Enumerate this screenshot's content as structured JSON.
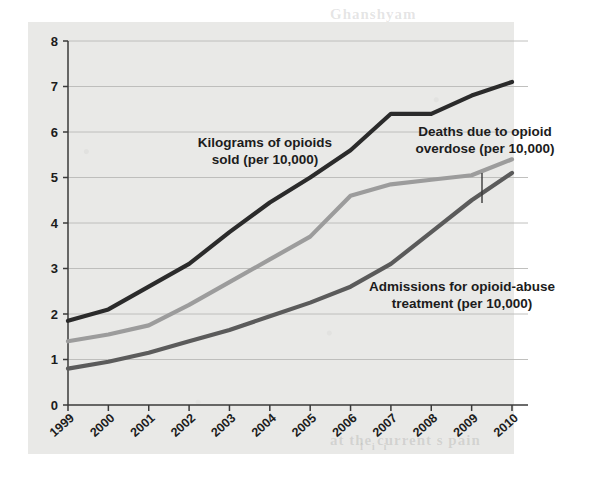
{
  "page": {
    "ghost_top": "Ghanshyam",
    "ghost_bottom": "at the current s pain",
    "ghost_mid": "i i i"
  },
  "chart_data": {
    "type": "line",
    "title": "",
    "xlabel": "",
    "ylabel": "No. (per US population)",
    "x": [
      1999,
      2000,
      2001,
      2002,
      2003,
      2004,
      2005,
      2006,
      2007,
      2008,
      2009,
      2010
    ],
    "categories": [
      "1999",
      "2000",
      "2001",
      "2002",
      "2003",
      "2004",
      "2005",
      "2006",
      "2007",
      "2008",
      "2009",
      "2010"
    ],
    "ylim": [
      0,
      8
    ],
    "yticks": [
      0,
      1,
      2,
      3,
      4,
      5,
      6,
      7,
      8
    ],
    "ytick_labels": [
      "0",
      "1",
      "2",
      "3",
      "4",
      "5",
      "6",
      "7",
      "8"
    ],
    "grid": true,
    "legend_position": "annotations-inline",
    "series": [
      {
        "name": "Kilograms of opioids sold (per 10,000)",
        "color": "#2b2b2b",
        "values": [
          1.85,
          2.1,
          2.6,
          3.1,
          3.8,
          4.45,
          5.0,
          5.6,
          6.4,
          6.4,
          6.8,
          7.1
        ]
      },
      {
        "name": "Deaths due to opioid overdose (per 10,000)",
        "color": "#9c9c9c",
        "values": [
          1.4,
          1.55,
          1.75,
          2.2,
          2.7,
          3.2,
          3.7,
          4.6,
          4.85,
          4.95,
          5.05,
          5.4
        ]
      },
      {
        "name": "Admissions for opioid-abuse treatment (per 10,000)",
        "color": "#5b5b5b",
        "values": [
          0.8,
          0.95,
          1.15,
          1.4,
          1.65,
          1.95,
          2.25,
          2.6,
          3.1,
          3.8,
          4.5,
          5.1
        ]
      }
    ],
    "annotations": [
      {
        "id": "annotation-opioids-sold",
        "lines": [
          "Kilograms of opioids",
          "sold (per 10,000)"
        ],
        "x": 265,
        "y": 147,
        "anchor": "middle",
        "leader": false
      },
      {
        "id": "annotation-overdose-deaths",
        "lines": [
          "Deaths due to opioid",
          "overdose (per 10,000)"
        ],
        "x": 485,
        "y": 136,
        "anchor": "middle",
        "leader": true
      },
      {
        "id": "annotation-treatment-admissions",
        "lines": [
          "Admissions for opioid-abuse",
          "treatment (per 10,000)"
        ],
        "x": 462,
        "y": 291,
        "anchor": "middle",
        "leader": false
      }
    ]
  }
}
